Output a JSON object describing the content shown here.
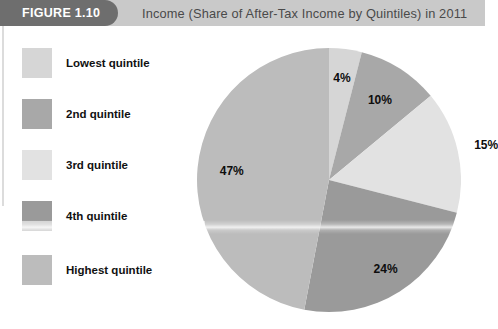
{
  "header": {
    "figure_tab_label": "FIGURE 1.10",
    "title": "Income (Share of After-Tax Income by Quintiles) in 2011",
    "tab_color": "#6e6e6e",
    "banner_color": "#c9c9c9",
    "tab_text_color": "#ffffff",
    "title_text_color": "#4a4a4a"
  },
  "legend": {
    "items": [
      {
        "label": "Lowest quintile",
        "color": "#d6d6d6"
      },
      {
        "label": "2nd quintile",
        "color": "#a8a8a8"
      },
      {
        "label": "3rd quintile",
        "color": "#e2e2e2"
      },
      {
        "label": "4th quintile",
        "color": "#9a9a9a"
      },
      {
        "label": "Highest quintile",
        "color": "#bcbcbc"
      }
    ]
  },
  "chart_data": {
    "type": "pie",
    "title": "Income (Share of After-Tax Income by Quintiles) in 2011",
    "xlabel": "",
    "ylabel": "",
    "legend_position": "left",
    "start_angle_deg": 0,
    "direction": "clockwise",
    "units": "percent",
    "categories": [
      "Lowest quintile",
      "2nd quintile",
      "3rd quintile",
      "4th quintile",
      "Highest quintile"
    ],
    "values": [
      4,
      10,
      15,
      24,
      47
    ],
    "labels": [
      "4%",
      "10%",
      "15%",
      "24%",
      "47%"
    ],
    "colors": [
      "#d6d6d6",
      "#a8a8a8",
      "#e2e2e2",
      "#9a9a9a",
      "#bcbcbc"
    ],
    "center": {
      "x": 132,
      "y": 132
    },
    "radius": 132
  },
  "slice_labels": {
    "s0": "4%",
    "s1": "10%",
    "s2": "15%",
    "s3": "24%",
    "s4": "47%"
  }
}
